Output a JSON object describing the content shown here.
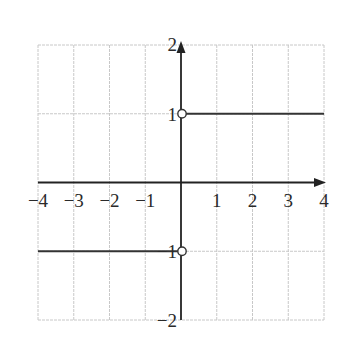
{
  "chart_data": {
    "type": "line",
    "title": "",
    "xlabel": "",
    "ylabel": "",
    "xlim": [
      -4,
      4
    ],
    "ylim": [
      -2,
      2
    ],
    "grid": true,
    "x_ticks": [
      -4,
      -3,
      -2,
      -1,
      1,
      2,
      3,
      4
    ],
    "x_tick_labels": [
      "−4",
      "−3",
      "−2",
      "−1",
      "1",
      "2",
      "3",
      "4"
    ],
    "y_ticks": [
      2,
      1,
      -1,
      -2
    ],
    "y_tick_labels": [
      "2",
      "1",
      "−1",
      "−2"
    ],
    "series": [
      {
        "name": "f(x) for x < 0",
        "x": [
          -4,
          0
        ],
        "y": [
          -1,
          -1
        ],
        "right_endpoint": "open"
      },
      {
        "name": "f(x) for x > 0",
        "x": [
          0,
          4
        ],
        "y": [
          1,
          1
        ],
        "left_endpoint": "open"
      }
    ],
    "open_points": [
      {
        "x": 0,
        "y": 1
      },
      {
        "x": 0,
        "y": -1
      }
    ],
    "colors": {
      "grid": "#c8c8c8",
      "axis": "#222222",
      "line": "#333333",
      "background": "#ffffff"
    }
  }
}
